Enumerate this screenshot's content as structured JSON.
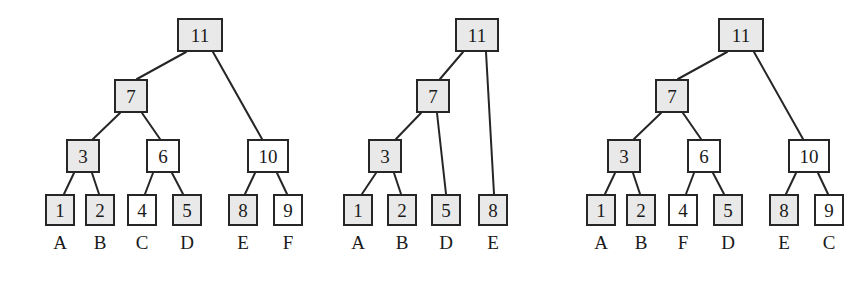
{
  "figure": {
    "title": "",
    "background_color": "#ffffff",
    "node_border_color": "#262626",
    "node_shaded_color": "#e9e9e9",
    "node_plain_color": "#ffffff",
    "edge_color": "#262626"
  },
  "trees": [
    {
      "id": "tree-left",
      "nodes": [
        {
          "id": "t1-n11",
          "value": "11",
          "shaded": true,
          "x": 177,
          "y": 18,
          "w": 46,
          "h": 34,
          "kind": "internal"
        },
        {
          "id": "t1-n7",
          "value": "7",
          "shaded": true,
          "x": 114,
          "y": 79,
          "w": 34,
          "h": 34,
          "kind": "internal"
        },
        {
          "id": "t1-n10",
          "value": "10",
          "shaded": false,
          "x": 247,
          "y": 139,
          "w": 42,
          "h": 34,
          "kind": "internal"
        },
        {
          "id": "t1-n3",
          "value": "3",
          "shaded": true,
          "x": 66,
          "y": 139,
          "w": 34,
          "h": 34,
          "kind": "internal"
        },
        {
          "id": "t1-n6",
          "value": "6",
          "shaded": false,
          "x": 146,
          "y": 139,
          "w": 34,
          "h": 34,
          "kind": "internal"
        },
        {
          "id": "t1-l1",
          "value": "1",
          "shaded": true,
          "x": 45,
          "y": 194,
          "w": 30,
          "h": 32,
          "kind": "leaf"
        },
        {
          "id": "t1-l2",
          "value": "2",
          "shaded": true,
          "x": 85,
          "y": 194,
          "w": 30,
          "h": 32,
          "kind": "leaf"
        },
        {
          "id": "t1-l4",
          "value": "4",
          "shaded": false,
          "x": 127,
          "y": 194,
          "w": 30,
          "h": 32,
          "kind": "leaf"
        },
        {
          "id": "t1-l5",
          "value": "5",
          "shaded": true,
          "x": 172,
          "y": 194,
          "w": 30,
          "h": 32,
          "kind": "leaf"
        },
        {
          "id": "t1-l8",
          "value": "8",
          "shaded": true,
          "x": 228,
          "y": 194,
          "w": 30,
          "h": 32,
          "kind": "leaf"
        },
        {
          "id": "t1-l9",
          "value": "9",
          "shaded": false,
          "x": 273,
          "y": 194,
          "w": 30,
          "h": 32,
          "kind": "leaf"
        }
      ],
      "edges": [
        {
          "from": "t1-n11",
          "to": "t1-n7",
          "x1": 186,
          "y1": 52,
          "x2": 137,
          "y2": 79
        },
        {
          "from": "t1-n11",
          "to": "t1-n10",
          "x1": 213,
          "y1": 52,
          "x2": 262,
          "y2": 139
        },
        {
          "from": "t1-n7",
          "to": "t1-n3",
          "x1": 120,
          "y1": 113,
          "x2": 93,
          "y2": 139
        },
        {
          "from": "t1-n7",
          "to": "t1-n6",
          "x1": 142,
          "y1": 113,
          "x2": 160,
          "y2": 139
        },
        {
          "from": "t1-n3",
          "to": "t1-l1",
          "x1": 74,
          "y1": 173,
          "x2": 64,
          "y2": 194
        },
        {
          "from": "t1-n3",
          "to": "t1-l2",
          "x1": 92,
          "y1": 173,
          "x2": 99,
          "y2": 194
        },
        {
          "from": "t1-n6",
          "to": "t1-l4",
          "x1": 153,
          "y1": 173,
          "x2": 145,
          "y2": 194
        },
        {
          "from": "t1-n6",
          "to": "t1-l5",
          "x1": 172,
          "y1": 173,
          "x2": 183,
          "y2": 194
        },
        {
          "from": "t1-n10",
          "to": "t1-l8",
          "x1": 255,
          "y1": 173,
          "x2": 245,
          "y2": 194
        },
        {
          "from": "t1-n10",
          "to": "t1-l9",
          "x1": 277,
          "y1": 173,
          "x2": 287,
          "y2": 194
        }
      ],
      "labels": [
        {
          "text": "A",
          "x": 45,
          "y": 232,
          "w": 30
        },
        {
          "text": "B",
          "x": 85,
          "y": 232,
          "w": 30
        },
        {
          "text": "C",
          "x": 127,
          "y": 232,
          "w": 30
        },
        {
          "text": "D",
          "x": 172,
          "y": 232,
          "w": 30
        },
        {
          "text": "E",
          "x": 228,
          "y": 232,
          "w": 30
        },
        {
          "text": "F",
          "x": 273,
          "y": 232,
          "w": 30
        }
      ]
    },
    {
      "id": "tree-middle",
      "nodes": [
        {
          "id": "t2-n11",
          "value": "11",
          "shaded": true,
          "x": 155,
          "y": 18,
          "w": 44,
          "h": 34,
          "kind": "internal"
        },
        {
          "id": "t2-n7",
          "value": "7",
          "shaded": true,
          "x": 116,
          "y": 79,
          "w": 34,
          "h": 34,
          "kind": "internal"
        },
        {
          "id": "t2-n3",
          "value": "3",
          "shaded": true,
          "x": 68,
          "y": 139,
          "w": 34,
          "h": 34,
          "kind": "internal"
        },
        {
          "id": "t2-l1",
          "value": "1",
          "shaded": true,
          "x": 43,
          "y": 194,
          "w": 30,
          "h": 32,
          "kind": "leaf"
        },
        {
          "id": "t2-l2",
          "value": "2",
          "shaded": true,
          "x": 87,
          "y": 194,
          "w": 30,
          "h": 32,
          "kind": "leaf"
        },
        {
          "id": "t2-l5",
          "value": "5",
          "shaded": true,
          "x": 131,
          "y": 194,
          "w": 30,
          "h": 32,
          "kind": "leaf"
        },
        {
          "id": "t2-l8",
          "value": "8",
          "shaded": true,
          "x": 178,
          "y": 194,
          "w": 30,
          "h": 32,
          "kind": "leaf"
        }
      ],
      "edges": [
        {
          "from": "t2-n11",
          "to": "t2-n7",
          "x1": 163,
          "y1": 52,
          "x2": 140,
          "y2": 79
        },
        {
          "from": "t2-n11",
          "to": "t2-l8",
          "x1": 186,
          "y1": 52,
          "x2": 194,
          "y2": 194
        },
        {
          "from": "t2-n7",
          "to": "t2-n3",
          "x1": 121,
          "y1": 113,
          "x2": 96,
          "y2": 139
        },
        {
          "from": "t2-n7",
          "to": "t2-l5",
          "x1": 137,
          "y1": 113,
          "x2": 146,
          "y2": 194
        },
        {
          "from": "t2-n3",
          "to": "t2-l1",
          "x1": 76,
          "y1": 173,
          "x2": 62,
          "y2": 194
        },
        {
          "from": "t2-n3",
          "to": "t2-l2",
          "x1": 94,
          "y1": 173,
          "x2": 101,
          "y2": 194
        }
      ],
      "labels": [
        {
          "text": "A",
          "x": 43,
          "y": 232,
          "w": 30
        },
        {
          "text": "B",
          "x": 87,
          "y": 232,
          "w": 30
        },
        {
          "text": "D",
          "x": 131,
          "y": 232,
          "w": 30
        },
        {
          "text": "E",
          "x": 178,
          "y": 232,
          "w": 30
        }
      ]
    },
    {
      "id": "tree-right",
      "nodes": [
        {
          "id": "t3-n11",
          "value": "11",
          "shaded": true,
          "x": 148,
          "y": 18,
          "w": 46,
          "h": 34,
          "kind": "internal"
        },
        {
          "id": "t3-n7",
          "value": "7",
          "shaded": true,
          "x": 85,
          "y": 79,
          "w": 34,
          "h": 34,
          "kind": "internal"
        },
        {
          "id": "t3-n10",
          "value": "10",
          "shaded": false,
          "x": 218,
          "y": 139,
          "w": 42,
          "h": 34,
          "kind": "internal"
        },
        {
          "id": "t3-n3",
          "value": "3",
          "shaded": true,
          "x": 37,
          "y": 139,
          "w": 34,
          "h": 34,
          "kind": "internal"
        },
        {
          "id": "t3-n6",
          "value": "6",
          "shaded": false,
          "x": 117,
          "y": 139,
          "w": 34,
          "h": 34,
          "kind": "internal"
        },
        {
          "id": "t3-l1",
          "value": "1",
          "shaded": true,
          "x": 16,
          "y": 194,
          "w": 30,
          "h": 32,
          "kind": "leaf"
        },
        {
          "id": "t3-l2",
          "value": "2",
          "shaded": true,
          "x": 56,
          "y": 194,
          "w": 30,
          "h": 32,
          "kind": "leaf"
        },
        {
          "id": "t3-l4",
          "value": "4",
          "shaded": false,
          "x": 98,
          "y": 194,
          "w": 30,
          "h": 32,
          "kind": "leaf"
        },
        {
          "id": "t3-l5",
          "value": "5",
          "shaded": true,
          "x": 143,
          "y": 194,
          "w": 30,
          "h": 32,
          "kind": "leaf"
        },
        {
          "id": "t3-l8",
          "value": "8",
          "shaded": true,
          "x": 199,
          "y": 194,
          "w": 30,
          "h": 32,
          "kind": "leaf"
        },
        {
          "id": "t3-l9",
          "value": "9",
          "shaded": false,
          "x": 244,
          "y": 194,
          "w": 30,
          "h": 32,
          "kind": "leaf"
        }
      ],
      "edges": [
        {
          "from": "t3-n11",
          "to": "t3-n7",
          "x1": 157,
          "y1": 52,
          "x2": 108,
          "y2": 79
        },
        {
          "from": "t3-n11",
          "to": "t3-n10",
          "x1": 184,
          "y1": 52,
          "x2": 233,
          "y2": 139
        },
        {
          "from": "t3-n7",
          "to": "t3-n3",
          "x1": 91,
          "y1": 113,
          "x2": 64,
          "y2": 139
        },
        {
          "from": "t3-n7",
          "to": "t3-n6",
          "x1": 113,
          "y1": 113,
          "x2": 131,
          "y2": 139
        },
        {
          "from": "t3-n3",
          "to": "t3-l1",
          "x1": 45,
          "y1": 173,
          "x2": 35,
          "y2": 194
        },
        {
          "from": "t3-n3",
          "to": "t3-l2",
          "x1": 63,
          "y1": 173,
          "x2": 70,
          "y2": 194
        },
        {
          "from": "t3-n6",
          "to": "t3-l4",
          "x1": 124,
          "y1": 173,
          "x2": 116,
          "y2": 194
        },
        {
          "from": "t3-n6",
          "to": "t3-l5",
          "x1": 143,
          "y1": 173,
          "x2": 154,
          "y2": 194
        },
        {
          "from": "t3-n10",
          "to": "t3-l8",
          "x1": 226,
          "y1": 173,
          "x2": 216,
          "y2": 194
        },
        {
          "from": "t3-n10",
          "to": "t3-l9",
          "x1": 248,
          "y1": 173,
          "x2": 258,
          "y2": 194
        }
      ],
      "labels": [
        {
          "text": "A",
          "x": 16,
          "y": 232,
          "w": 30
        },
        {
          "text": "B",
          "x": 56,
          "y": 232,
          "w": 30
        },
        {
          "text": "F",
          "x": 98,
          "y": 232,
          "w": 30
        },
        {
          "text": "D",
          "x": 143,
          "y": 232,
          "w": 30
        },
        {
          "text": "E",
          "x": 199,
          "y": 232,
          "w": 30
        },
        {
          "text": "C",
          "x": 244,
          "y": 232,
          "w": 30
        }
      ]
    }
  ],
  "tree_offsets": [
    0,
    300,
    570
  ]
}
